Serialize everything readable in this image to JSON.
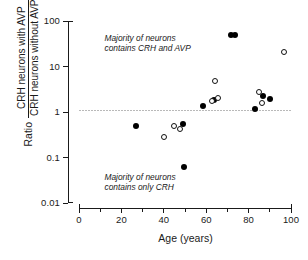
{
  "chart_data": {
    "type": "scatter",
    "title": "",
    "xlabel": "Age (years)",
    "ylabel_prefix": "Ratio",
    "ylabel_numerator": "CRH neurons with AVP",
    "ylabel_denominator": "CRH neurons without AVP",
    "xlim": [
      0,
      100
    ],
    "ylim": [
      0.01,
      100
    ],
    "yscale": "log",
    "xscale": "linear",
    "grid": false,
    "legend": "none",
    "xticks": [
      0,
      20,
      40,
      60,
      80,
      100
    ],
    "xticklabels": [
      "0",
      "20",
      "40",
      "60",
      "80",
      "100"
    ],
    "xminorticks": [
      10,
      30,
      50,
      70,
      90
    ],
    "yticks": [
      0.01,
      0.1,
      1,
      10,
      100
    ],
    "yticklabels": [
      "0.01",
      "0.1",
      "1",
      "10",
      "100"
    ],
    "reference_line": {
      "y": 1,
      "style": "dotted",
      "color": "#b9b9b9"
    },
    "annotations": [
      {
        "text": "Majority of neurons\ncontains CRH and AVP",
        "x": 12,
        "y": 40
      },
      {
        "text": "Majority of neurons\ncontains only CRH",
        "x": 12,
        "y": 0.035
      }
    ],
    "series": [
      {
        "name": "filled",
        "marker": "filled-circle",
        "color": "#000000",
        "points": [
          {
            "x": 27,
            "y": 0.5
          },
          {
            "x": 49,
            "y": 0.55
          },
          {
            "x": 49.5,
            "y": 0.063
          },
          {
            "x": 58.5,
            "y": 1.33
          },
          {
            "x": 63.5,
            "y": 1.8
          },
          {
            "x": 71.5,
            "y": 50
          },
          {
            "x": 73.5,
            "y": 50
          },
          {
            "x": 83,
            "y": 1.18
          },
          {
            "x": 87,
            "y": 2.3
          },
          {
            "x": 90,
            "y": 1.9
          }
        ]
      },
      {
        "name": "open",
        "marker": "open-circle",
        "color": "#ffffff",
        "points": [
          {
            "x": 40,
            "y": 0.285
          },
          {
            "x": 45,
            "y": 0.5
          },
          {
            "x": 47.5,
            "y": 0.43
          },
          {
            "x": 62.5,
            "y": 1.75
          },
          {
            "x": 64,
            "y": 4.8
          },
          {
            "x": 65.5,
            "y": 2.0
          },
          {
            "x": 85,
            "y": 2.75
          },
          {
            "x": 86.5,
            "y": 1.6
          },
          {
            "x": 96.5,
            "y": 21.0
          }
        ]
      }
    ]
  }
}
